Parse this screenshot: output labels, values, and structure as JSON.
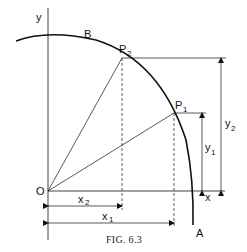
{
  "figure": {
    "caption": "FIG. 6.3",
    "axes": {
      "x_label": "x",
      "y_label": "y",
      "origin_label": "O"
    },
    "points": {
      "B": "B",
      "A": "A",
      "P2": {
        "main": "P",
        "sub": "2"
      },
      "P1": {
        "main": "P",
        "sub": "1"
      }
    },
    "dimensions": {
      "x1": {
        "main": "x",
        "sub": "1"
      },
      "x2": {
        "main": "x",
        "sub": "2"
      },
      "y1": {
        "main": "y",
        "sub": "1"
      },
      "y2": {
        "main": "y",
        "sub": "2"
      }
    },
    "colors": {
      "ink": "#111111",
      "background": "#ffffff"
    }
  }
}
